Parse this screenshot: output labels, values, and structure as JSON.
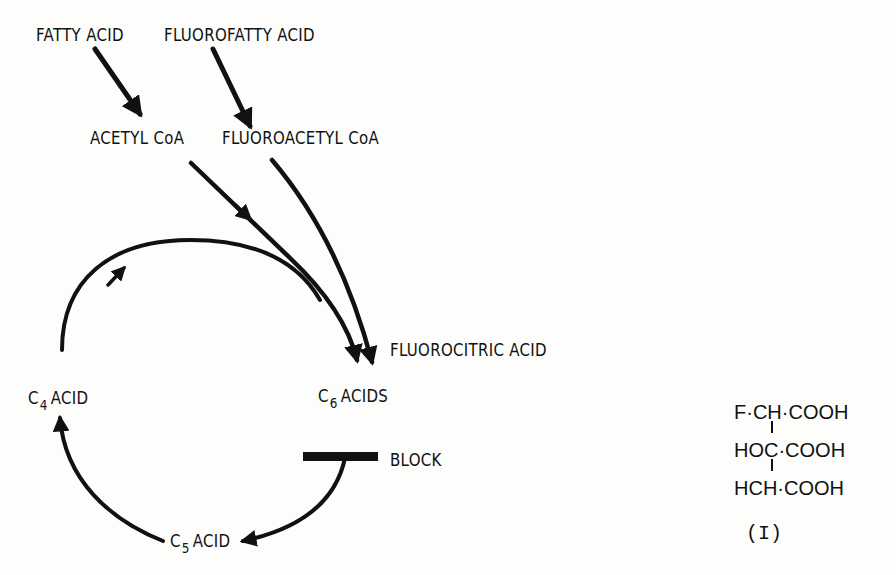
{
  "diagram": {
    "type": "metabolic pathway",
    "nodes": {
      "fatty_acid": "FATTY ACID",
      "fluorofatty_acid": "FLUOROFATTY ACID",
      "acetyl_coa": "ACETYL CoA",
      "fluoroacetyl_coa": "FLUOROACETYL CoA",
      "fluorocitric_acid": "FLUOROCITRIC ACID",
      "c4_acid": {
        "prefix": "C",
        "subscript": "4",
        "suffix": "ACID"
      },
      "c5_acid": {
        "prefix": "C",
        "subscript": "5",
        "suffix": "ACID"
      },
      "c6_acids": {
        "prefix": "C",
        "subscript": "6",
        "suffix": "ACIDS"
      },
      "block": "BLOCK"
    },
    "edges": [
      {
        "from": "FATTY ACID",
        "to": "ACETYL CoA"
      },
      {
        "from": "FLUOROFATTY ACID",
        "to": "FLUOROACETYL CoA"
      },
      {
        "from": "ACETYL CoA",
        "to": "C6 ACIDS"
      },
      {
        "from": "FLUOROACETYL CoA",
        "to": "C6 ACIDS"
      },
      {
        "from": "C4 ACID",
        "to": "C6 ACIDS"
      },
      {
        "from": "C6 ACIDS",
        "to": "C5 ACID",
        "blocked": true
      },
      {
        "from": "C5 ACID",
        "to": "C4 ACID"
      }
    ]
  },
  "formula": {
    "lines": [
      {
        "left": "F·",
        "center": "CH",
        "right": "·COOH"
      },
      {
        "left": "HO",
        "center": "C",
        "right": "·COOH"
      },
      {
        "left": "H",
        "center": "CH",
        "right": "·COOH"
      }
    ],
    "label": "(I)"
  }
}
